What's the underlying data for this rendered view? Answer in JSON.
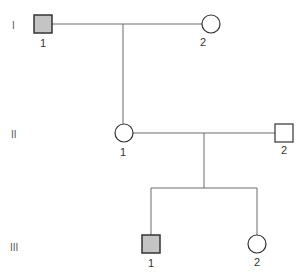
{
  "diagram": {
    "type": "pedigree",
    "colors": {
      "line": "#6a6a6a",
      "stroke": "#333333",
      "affected_fill": "#c4c4c4",
      "unaffected_fill": "#ffffff"
    },
    "generations": [
      {
        "label": "I",
        "individuals": [
          {
            "id": "1",
            "sex": "male",
            "affected": true
          },
          {
            "id": "2",
            "sex": "female",
            "affected": false
          }
        ]
      },
      {
        "label": "II",
        "individuals": [
          {
            "id": "1",
            "sex": "female",
            "affected": false
          },
          {
            "id": "2",
            "sex": "male",
            "affected": false
          }
        ]
      },
      {
        "label": "III",
        "individuals": [
          {
            "id": "1",
            "sex": "male",
            "affected": true
          },
          {
            "id": "2",
            "sex": "female",
            "affected": false
          }
        ]
      }
    ]
  }
}
